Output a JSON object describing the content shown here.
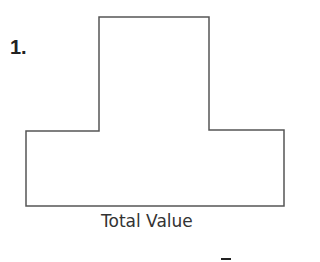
{
  "problem": {
    "number_label": "1.",
    "caption": "Total Value",
    "shape": {
      "type": "t-shaped-polygon",
      "stroke_color": "#555555",
      "points": [
        [
          99,
          17
        ],
        [
          209,
          17
        ],
        [
          209,
          130
        ],
        [
          284,
          130
        ],
        [
          284,
          206
        ],
        [
          26,
          206
        ],
        [
          26,
          131
        ],
        [
          99,
          131
        ]
      ]
    },
    "answer_mark": "–"
  }
}
